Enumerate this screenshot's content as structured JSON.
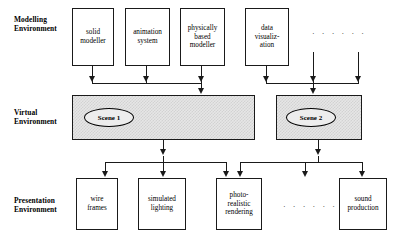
{
  "tiers": [
    {
      "id": "modelling",
      "label": "Modelling\nEnvironment"
    },
    {
      "id": "virtual",
      "label": "Virtual\nEnvironment"
    },
    {
      "id": "presentation",
      "label": "Presentation\nEnvironment"
    }
  ],
  "modelling_nodes": [
    {
      "id": "solid-modeller",
      "label": "solid\nmodeller"
    },
    {
      "id": "animation-system",
      "label": "animation\nsystem"
    },
    {
      "id": "physically-based-modeller",
      "label": "physically\nbased\nmodeller"
    },
    {
      "id": "data-visualization",
      "label": "data\nvisualiz-\nation"
    }
  ],
  "modelling_ellipsis": "· · · · · ·",
  "scenes": [
    {
      "id": "scene-1",
      "label": "Scene 1"
    },
    {
      "id": "scene-2",
      "label": "Scene 2"
    }
  ],
  "presentation_nodes": [
    {
      "id": "wire-frames",
      "label": "wire\nframes"
    },
    {
      "id": "simulated-lighting",
      "label": "simulated\nlighting"
    },
    {
      "id": "photo-realistic-rendering",
      "label": "photo-\nrealistic\nrendering"
    },
    {
      "id": "sound-production",
      "label": "sound\nproduction"
    }
  ],
  "presentation_ellipsis": "· · · · · ·",
  "colors": {
    "line": "#1a1a1a",
    "scene_fill": "#e6e6e6",
    "background": "#ffffff"
  }
}
